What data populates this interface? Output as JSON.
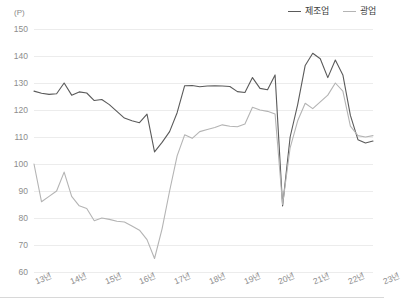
{
  "legend": {
    "position": "top-right",
    "items": [
      {
        "label": "제조업",
        "color": "#5a5a5a",
        "name": "manufacturing"
      },
      {
        "label": "광업",
        "color": "#b4b4b4",
        "name": "mining"
      }
    ]
  },
  "axis": {
    "unit_label": "(P)",
    "y_ticks": [
      "150",
      "140",
      "130",
      "120",
      "110",
      "100",
      "90",
      "80",
      "70",
      "60"
    ],
    "x_ticks": [
      "13년",
      "14년",
      "15년",
      "16년",
      "17년",
      "18년",
      "19년",
      "20년",
      "21년",
      "22년",
      "23년"
    ]
  },
  "chart_data": {
    "type": "line",
    "title": "",
    "xlabel": "",
    "ylabel": "(P)",
    "ylim": [
      60,
      150
    ],
    "ytick_step": 10,
    "grid": true,
    "legend_position": "top-right",
    "categories": [
      "13년",
      "14년",
      "15년",
      "16년",
      "17년",
      "18년",
      "19년",
      "20년",
      "21년",
      "22년",
      "23년"
    ],
    "x_range": [
      2013.0,
      2022.75
    ],
    "series": [
      {
        "name": "제조업",
        "color": "#5a5a5a",
        "x": [
          2013.0,
          2013.25,
          2013.5,
          2013.75,
          2014.0,
          2014.25,
          2014.5,
          2014.75,
          2015.0,
          2015.25,
          2015.5,
          2015.75,
          2016.0,
          2016.25,
          2016.5,
          2016.75,
          2017.0,
          2017.25,
          2017.5,
          2017.75,
          2018.0,
          2018.25,
          2018.5,
          2018.75,
          2019.0,
          2019.25,
          2019.5,
          2019.75,
          2020.0,
          2020.25,
          2020.5,
          2020.75,
          2021.0,
          2021.25,
          2021.5,
          2021.75,
          2022.0,
          2022.25,
          2022.5,
          2022.75
        ],
        "values": [
          127.0,
          126.2,
          125.8,
          126.0,
          130.0,
          125.5,
          126.7,
          126.3,
          123.5,
          123.9,
          122.0,
          119.5,
          117.0,
          116.0,
          115.3,
          118.5,
          104.5,
          108.0,
          112.0,
          119.0,
          129.0,
          129.1,
          128.6,
          128.9,
          129.0,
          128.9,
          128.7,
          126.8,
          126.5,
          132.0,
          128.0,
          127.5,
          133.0,
          84.5,
          110.0,
          122.0,
          136.5,
          141.0,
          139.0,
          132.0
        ],
        "values_tail": [
          138.5,
          133.0,
          118.0,
          109.0,
          107.8,
          108.5
        ]
      },
      {
        "name": "광업",
        "color": "#b4b4b4",
        "x": [
          2013.0,
          2013.25,
          2013.5,
          2013.75,
          2014.0,
          2014.25,
          2014.5,
          2014.75,
          2015.0,
          2015.25,
          2015.5,
          2015.75,
          2016.0,
          2016.25,
          2016.5,
          2016.75,
          2017.0,
          2017.25,
          2017.5,
          2017.75,
          2018.0,
          2018.25,
          2018.5,
          2018.75,
          2019.0,
          2019.25,
          2019.5,
          2019.75,
          2020.0,
          2020.25,
          2020.5,
          2020.75,
          2021.0,
          2021.25,
          2021.5,
          2021.75,
          2022.0,
          2022.25,
          2022.5,
          2022.75
        ],
        "values": [
          100.0,
          86.0,
          88.0,
          90.0,
          97.0,
          88.0,
          84.5,
          83.5,
          79.0,
          80.0,
          79.5,
          78.8,
          78.5,
          77.0,
          75.5,
          72.0,
          65.0,
          76.0,
          90.0,
          103.0,
          110.8,
          109.5,
          112.0,
          112.8,
          113.5,
          114.5,
          114.0,
          113.8,
          114.8,
          121.0,
          120.0,
          119.5,
          118.5,
          85.0,
          106.0,
          116.0,
          122.5,
          120.5,
          123.0,
          125.5
        ],
        "values_tail": [
          130.0,
          127.0,
          114.0,
          110.5,
          110.0,
          110.5
        ]
      }
    ],
    "annotations": [
      {
        "text": "2020 sharp trough",
        "series": "제조업",
        "value": 84.5
      },
      {
        "text": "2020 sharp trough",
        "series": "광업",
        "value": 85.0
      },
      {
        "text": "2021 peak",
        "series": "제조업",
        "value": 141.0
      },
      {
        "text": "2021 peak",
        "series": "광업",
        "value": 130.0
      },
      {
        "text": "2016 trough",
        "series": "제조업",
        "value": 104.5
      },
      {
        "text": "2016 trough",
        "series": "광업",
        "value": 65.0
      }
    ]
  }
}
